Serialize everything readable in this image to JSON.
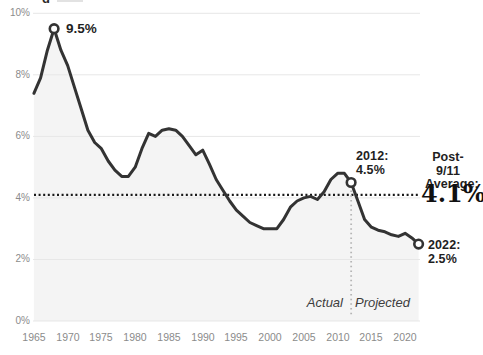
{
  "header": {
    "clipped_title_fragment": "g"
  },
  "chart_data": {
    "type": "line",
    "title": "",
    "y_axis": {
      "range": [
        0,
        10
      ],
      "unit": "%",
      "ticks": [
        {
          "label": "10%",
          "value": 10
        },
        {
          "label": "8%",
          "value": 8
        },
        {
          "label": "6%",
          "value": 6
        },
        {
          "label": "4%",
          "value": 4
        },
        {
          "label": "2%",
          "value": 2
        },
        {
          "label": "0%",
          "value": 0
        }
      ]
    },
    "x_axis": {
      "range": [
        1965,
        2022
      ],
      "ticks": [
        1965,
        1970,
        1975,
        1980,
        1985,
        1990,
        1995,
        2000,
        2005,
        2010,
        2015,
        2020
      ]
    },
    "series": [
      {
        "x_start": 1965,
        "x_step": 1,
        "values": [
          7.4,
          7.9,
          8.8,
          9.5,
          8.8,
          8.3,
          7.6,
          6.9,
          6.2,
          5.8,
          5.6,
          5.2,
          4.9,
          4.7,
          4.7,
          5.0,
          5.6,
          6.1,
          6.0,
          6.2,
          6.25,
          6.2,
          6.0,
          5.7,
          5.4,
          5.55,
          5.1,
          4.6,
          4.25,
          3.9,
          3.6,
          3.4,
          3.2,
          3.1,
          3.0,
          3.0,
          3.0,
          3.3,
          3.7,
          3.9,
          4.0,
          4.05,
          3.95,
          4.2,
          4.6,
          4.8,
          4.8,
          4.5,
          3.9,
          3.3,
          3.05,
          2.95,
          2.9,
          2.8,
          2.75,
          2.85,
          2.7,
          2.5
        ]
      }
    ],
    "divider": {
      "year": 2012,
      "left_label": "Actual",
      "right_label": "Projected"
    },
    "average_line": {
      "value": 4.1,
      "label_line1": "Post-9/11",
      "label_line2": "Average:",
      "value_label": "4.1%"
    },
    "callouts": {
      "peak": {
        "year": 1968,
        "value": 9.5,
        "label": "9.5%"
      },
      "p2012": {
        "year": 2012,
        "value": 4.5,
        "line1": "2012:",
        "line2": "4.5%"
      },
      "p2022": {
        "year": 2022,
        "value": 2.5,
        "line1": "2022:",
        "line2": "2.5%"
      }
    },
    "legend": "none",
    "grid": "horizontal",
    "colors": {
      "line": "#333333",
      "area_fill": "#f4f4f4",
      "grid": "#e7e7e7",
      "average_dots": "#1a1a1a",
      "divider_dots": "#b5b5b5",
      "tick_text": "#8b8b8b",
      "annotation_text": "#1f1f1f",
      "marker_fill": "#ffffff"
    }
  }
}
